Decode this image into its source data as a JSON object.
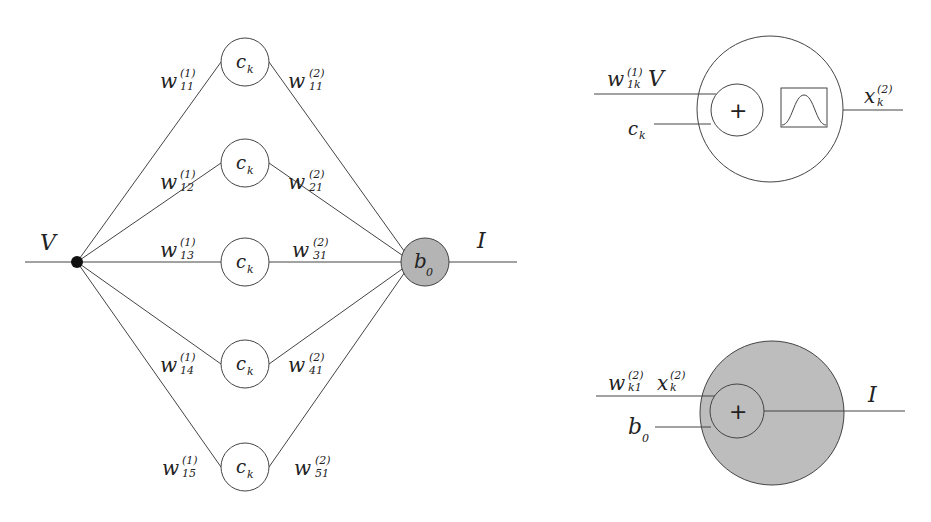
{
  "network": {
    "input_label": "V",
    "output_label": "I",
    "output_node_label": "b",
    "output_node_sub": "0",
    "hidden_node_label": "c",
    "hidden_node_sub": "k",
    "hidden_nodes": [
      {
        "w1_sup": "(1)",
        "w1_sub": "11",
        "w2_sup": "(2)",
        "w2_sub": "11"
      },
      {
        "w1_sup": "(1)",
        "w1_sub": "12",
        "w2_sup": "(2)",
        "w2_sub": "21"
      },
      {
        "w1_sup": "(1)",
        "w1_sub": "13",
        "w2_sup": "(2)",
        "w2_sub": "31"
      },
      {
        "w1_sup": "(1)",
        "w1_sub": "14",
        "w2_sup": "(2)",
        "w2_sub": "41"
      },
      {
        "w1_sup": "(1)",
        "w1_sub": "15",
        "w2_sup": "(2)",
        "w2_sub": "51"
      }
    ],
    "weight_symbol": "w",
    "colors": {
      "output_fill": "#b4b4b4",
      "line": "#333333",
      "input_node": "#111111"
    }
  },
  "hidden_neuron_detail": {
    "input1_w": "w",
    "input1_sup": "(1)",
    "input1_sub": "1k",
    "input1_var": "V",
    "input2": "c",
    "input2_sub": "k",
    "sum_symbol": "+",
    "output": "x",
    "output_sup": "(2)",
    "output_sub": "k",
    "activation": "gaussian"
  },
  "output_neuron_detail": {
    "input1_w": "w",
    "input1_sup": "(2)",
    "input1_sub": "k1",
    "input1_x": "x",
    "input1_x_sup": "(2)",
    "input1_x_sub": "k",
    "input2": "b",
    "input2_sub": "0",
    "sum_symbol": "+",
    "output": "I",
    "fill": "#bdbdbd"
  }
}
